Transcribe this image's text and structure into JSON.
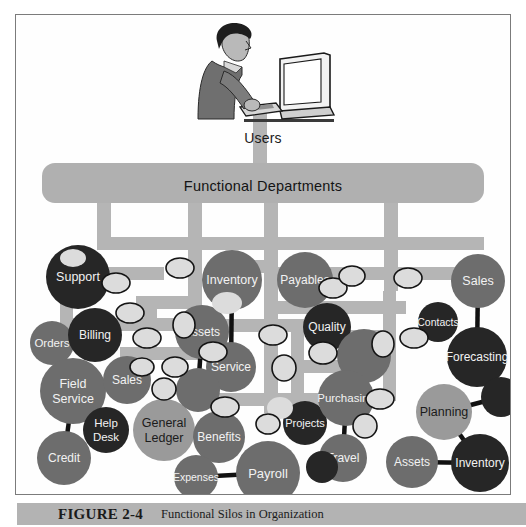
{
  "figure": {
    "caption_number": "FIGURE 2-4",
    "caption_text": "Functional Silos in Organization",
    "users_label": "Users",
    "departments_bar_label": "Functional Departments"
  },
  "colors": {
    "pipe_gray": "#b5b5b5",
    "bar_gray": "#b0b0b0",
    "node_dark": "#262626",
    "node_mid": "#6d6d6d",
    "node_light": "#9a9a9a",
    "ellipse_fill": "#dcdcdc",
    "connector": "#111111",
    "caption_bar": "#b3b3b3",
    "frame_border": "#7b7b7b"
  },
  "nodes": [
    {
      "id": "support",
      "label": "Support",
      "cx": 62,
      "cy": 262,
      "r": 32,
      "tone": "dark",
      "fs": 12.5
    },
    {
      "id": "orders",
      "label": "Orders",
      "cx": 36,
      "cy": 328,
      "r": 22,
      "tone": "mid",
      "fs": 11.5
    },
    {
      "id": "billing",
      "label": "Billing",
      "cx": 79,
      "cy": 320,
      "r": 27,
      "tone": "dark",
      "fs": 12
    },
    {
      "id": "field-service",
      "label": "Field\nService",
      "cx": 57,
      "cy": 376,
      "r": 33,
      "tone": "mid",
      "fs": 12.5
    },
    {
      "id": "sales-left",
      "label": "Sales",
      "cx": 111,
      "cy": 365,
      "r": 24,
      "tone": "mid",
      "fs": 12
    },
    {
      "id": "help-desk",
      "label": "Help\nDesk",
      "cx": 90,
      "cy": 415,
      "r": 23,
      "tone": "dark",
      "fs": 11.5
    },
    {
      "id": "credit",
      "label": "Credit",
      "cx": 48,
      "cy": 443,
      "r": 27,
      "tone": "mid",
      "fs": 12
    },
    {
      "id": "general-ledger",
      "label": "General\nLedger",
      "cx": 148,
      "cy": 415,
      "r": 31,
      "tone": "light",
      "fs": 12.5
    },
    {
      "id": "benefits",
      "label": "Benefits",
      "cx": 203,
      "cy": 422,
      "r": 26,
      "tone": "mid",
      "fs": 12
    },
    {
      "id": "expenses",
      "label": "Expenses",
      "cx": 180,
      "cy": 462,
      "r": 22,
      "tone": "mid",
      "fs": 10.5
    },
    {
      "id": "payroll",
      "label": "Payroll",
      "cx": 252,
      "cy": 458,
      "r": 32,
      "tone": "mid",
      "fs": 13
    },
    {
      "id": "inventory-top",
      "label": "Inventory",
      "cx": 216,
      "cy": 265,
      "r": 30,
      "tone": "mid",
      "fs": 12.5
    },
    {
      "id": "assets-mid",
      "label": "Assets",
      "cx": 186,
      "cy": 317,
      "r": 27,
      "tone": "mid",
      "fs": 12
    },
    {
      "id": "service",
      "label": "Service",
      "cx": 215,
      "cy": 352,
      "r": 25,
      "tone": "mid",
      "fs": 12
    },
    {
      "id": "unlabeled-a",
      "label": "",
      "cx": 182,
      "cy": 375,
      "r": 22,
      "tone": "mid",
      "fs": 11
    },
    {
      "id": "payables",
      "label": "Payables",
      "cx": 289,
      "cy": 265,
      "r": 28,
      "tone": "mid",
      "fs": 12
    },
    {
      "id": "quality",
      "label": "Quality",
      "cx": 311,
      "cy": 312,
      "r": 24,
      "tone": "dark",
      "fs": 12
    },
    {
      "id": "unlabeled-b",
      "label": "",
      "cx": 348,
      "cy": 341,
      "r": 27,
      "tone": "mid",
      "fs": 11
    },
    {
      "id": "projects",
      "label": "Projects",
      "cx": 289,
      "cy": 408,
      "r": 22,
      "tone": "dark",
      "fs": 11
    },
    {
      "id": "purchasing",
      "label": "Purchasing",
      "cx": 330,
      "cy": 383,
      "r": 28,
      "tone": "mid",
      "fs": 11.5
    },
    {
      "id": "travel",
      "label": "Travel",
      "cx": 327,
      "cy": 443,
      "r": 24,
      "tone": "mid",
      "fs": 12
    },
    {
      "id": "unlabeled-c",
      "label": "",
      "cx": 306,
      "cy": 452,
      "r": 16,
      "tone": "dark",
      "fs": 10
    },
    {
      "id": "sales-right",
      "label": "Sales",
      "cx": 462,
      "cy": 266,
      "r": 27,
      "tone": "mid",
      "fs": 12.5
    },
    {
      "id": "contacts",
      "label": "Contacts",
      "cx": 422,
      "cy": 307,
      "r": 20,
      "tone": "dark",
      "fs": 10.5
    },
    {
      "id": "forecasting",
      "label": "Forecasting",
      "cx": 461,
      "cy": 342,
      "r": 30,
      "tone": "dark",
      "fs": 12
    },
    {
      "id": "planning",
      "label": "Planning",
      "cx": 428,
      "cy": 397,
      "r": 28,
      "tone": "light",
      "fs": 12.5
    },
    {
      "id": "unlabeled-d",
      "label": "",
      "cx": 485,
      "cy": 382,
      "r": 20,
      "tone": "dark",
      "fs": 10
    },
    {
      "id": "assets-right",
      "label": "Assets",
      "cx": 396,
      "cy": 447,
      "r": 26,
      "tone": "mid",
      "fs": 12
    },
    {
      "id": "inventory-right",
      "label": "Inventory",
      "cx": 464,
      "cy": 448,
      "r": 29,
      "tone": "dark",
      "fs": 12
    }
  ],
  "connectors": [
    {
      "from": "orders",
      "to": "billing"
    },
    {
      "from": "orders",
      "to": "field-service"
    },
    {
      "from": "field-service",
      "to": "sales-left"
    },
    {
      "from": "field-service",
      "to": "credit"
    },
    {
      "from": "general-ledger",
      "to": "benefits"
    },
    {
      "from": "expenses",
      "to": "payroll"
    },
    {
      "from": "inventory-top",
      "to": "service"
    },
    {
      "from": "assets-mid",
      "to": "unlabeled-a"
    },
    {
      "from": "purchasing",
      "to": "travel"
    },
    {
      "from": "sales-right",
      "to": "forecasting"
    },
    {
      "from": "planning",
      "to": "unlabeled-d"
    },
    {
      "from": "assets-right",
      "to": "inventory-right"
    },
    {
      "from": "planning",
      "to": "inventory-right"
    }
  ],
  "small_ellipses": [
    {
      "cx": 57,
      "cy": 243,
      "rx": 13,
      "ry": 9,
      "bordered": false
    },
    {
      "cx": 100,
      "cy": 268,
      "rx": 14,
      "ry": 10,
      "bordered": true
    },
    {
      "cx": 114,
      "cy": 298,
      "rx": 14,
      "ry": 10,
      "bordered": true
    },
    {
      "cx": 131,
      "cy": 323,
      "rx": 14,
      "ry": 10,
      "bordered": true
    },
    {
      "cx": 148,
      "cy": 374,
      "rx": 12,
      "ry": 11,
      "bordered": true
    },
    {
      "cx": 126,
      "cy": 352,
      "rx": 12,
      "ry": 9,
      "bordered": true
    },
    {
      "cx": 168,
      "cy": 310,
      "rx": 11,
      "ry": 13,
      "bordered": true
    },
    {
      "cx": 197,
      "cy": 337,
      "rx": 14,
      "ry": 10,
      "bordered": true
    },
    {
      "cx": 211,
      "cy": 288,
      "rx": 15,
      "ry": 11,
      "bordered": false
    },
    {
      "cx": 164,
      "cy": 253,
      "rx": 14,
      "ry": 10,
      "bordered": true
    },
    {
      "cx": 159,
      "cy": 352,
      "rx": 13,
      "ry": 10,
      "bordered": true
    },
    {
      "cx": 209,
      "cy": 392,
      "rx": 14,
      "ry": 10,
      "bordered": true
    },
    {
      "cx": 257,
      "cy": 320,
      "rx": 14,
      "ry": 10,
      "bordered": true
    },
    {
      "cx": 268,
      "cy": 353,
      "rx": 12,
      "ry": 13,
      "bordered": true
    },
    {
      "cx": 264,
      "cy": 393,
      "rx": 13,
      "ry": 11,
      "bordered": false
    },
    {
      "cx": 252,
      "cy": 409,
      "rx": 12,
      "ry": 10,
      "bordered": true
    },
    {
      "cx": 317,
      "cy": 273,
      "rx": 14,
      "ry": 10,
      "bordered": true
    },
    {
      "cx": 336,
      "cy": 261,
      "rx": 13,
      "ry": 10,
      "bordered": true
    },
    {
      "cx": 307,
      "cy": 338,
      "rx": 14,
      "ry": 11,
      "bordered": true
    },
    {
      "cx": 367,
      "cy": 329,
      "rx": 11,
      "ry": 13,
      "bordered": true
    },
    {
      "cx": 364,
      "cy": 384,
      "rx": 14,
      "ry": 10,
      "bordered": true
    },
    {
      "cx": 392,
      "cy": 263,
      "rx": 14,
      "ry": 10,
      "bordered": true
    },
    {
      "cx": 398,
      "cy": 323,
      "rx": 14,
      "ry": 10,
      "bordered": true
    },
    {
      "cx": 349,
      "cy": 411,
      "rx": 12,
      "ry": 12,
      "bordered": true
    },
    {
      "cx": 337,
      "cy": 447,
      "rx": 0,
      "ry": 0,
      "bordered": true
    }
  ],
  "pipes": {
    "bar": {
      "x": 26,
      "y": 148,
      "w": 442,
      "h": 40,
      "rx": 13
    },
    "stem_top": {
      "x": 237,
      "y": 96,
      "w": 14,
      "h": 54
    },
    "vertical_stems": [
      {
        "x": 81,
        "y": 186,
        "w": 14,
        "h": 48
      },
      {
        "x": 172,
        "y": 186,
        "w": 14,
        "h": 118
      },
      {
        "x": 248,
        "y": 186,
        "w": 14,
        "h": 212
      },
      {
        "x": 368,
        "y": 186,
        "w": 14,
        "h": 90
      }
    ],
    "segments": [
      {
        "x": 81,
        "y": 222,
        "w": 105,
        "h": 13
      },
      {
        "x": 81,
        "y": 252,
        "w": 67,
        "h": 13
      },
      {
        "x": 120,
        "y": 281,
        "w": 66,
        "h": 13
      },
      {
        "x": 44,
        "y": 303,
        "w": 142,
        "h": 13
      },
      {
        "x": 172,
        "y": 222,
        "w": 90,
        "h": 13
      },
      {
        "x": 195,
        "y": 245,
        "w": 67,
        "h": 13
      },
      {
        "x": 172,
        "y": 304,
        "w": 116,
        "h": 13
      },
      {
        "x": 172,
        "y": 332,
        "w": 46,
        "h": 13
      },
      {
        "x": 104,
        "y": 332,
        "w": 68,
        "h": 13
      },
      {
        "x": 248,
        "y": 222,
        "w": 132,
        "h": 13
      },
      {
        "x": 262,
        "y": 252,
        "w": 120,
        "h": 13
      },
      {
        "x": 262,
        "y": 286,
        "w": 128,
        "h": 13
      },
      {
        "x": 248,
        "y": 345,
        "w": 98,
        "h": 13
      },
      {
        "x": 248,
        "y": 378,
        "w": 84,
        "h": 13
      },
      {
        "x": 194,
        "y": 378,
        "w": 60,
        "h": 13
      },
      {
        "x": 368,
        "y": 222,
        "w": 100,
        "h": 13
      },
      {
        "x": 380,
        "y": 252,
        "w": 88,
        "h": 13
      },
      {
        "x": 300,
        "y": 315,
        "w": 70,
        "h": 13
      }
    ],
    "extra_vertical": [
      {
        "x": 367,
        "y": 276,
        "w": 13,
        "h": 52
      },
      {
        "x": 367,
        "y": 328,
        "w": 13,
        "h": 58
      },
      {
        "x": 186,
        "y": 304,
        "w": 13,
        "h": 38
      },
      {
        "x": 275,
        "y": 315,
        "w": 13,
        "h": 70
      },
      {
        "x": 128,
        "y": 281,
        "w": 13,
        "h": 52
      },
      {
        "x": 44,
        "y": 272,
        "w": 13,
        "h": 44
      }
    ]
  }
}
